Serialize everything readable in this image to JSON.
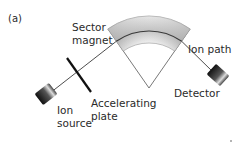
{
  "figure": {
    "panel_label": "(a)",
    "labels": {
      "sector_magnet": [
        "Sector",
        "magnet"
      ],
      "ion_path": "Ion path",
      "ion_source": [
        "Ion",
        "source"
      ],
      "accelerating_plate": [
        "Accelerating",
        "plate"
      ],
      "detector": "Detector"
    },
    "colors": {
      "line": "#3a3a3a",
      "plate": "#111111",
      "magnet_light": "#f2f2f2",
      "magnet_dark": "#a8a8a8",
      "block_dark": "#111111",
      "block_light": "#d8d8d8",
      "text": "#2a2a2a"
    }
  }
}
